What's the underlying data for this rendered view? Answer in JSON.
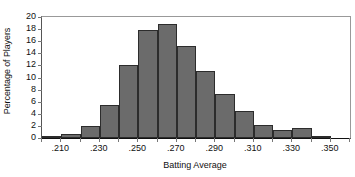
{
  "chart_data": {
    "type": "bar",
    "title": "",
    "subtitle": "",
    "xlabel": "Batting Average",
    "ylabel": "Percentage of Players",
    "grid": false,
    "legend": null,
    "legend_position": "none",
    "bar_color": "#6b6b6b",
    "bar_edge_color": "#2c2c2c",
    "axis_color": "#111111",
    "background": "#ffffff",
    "xlim": [
      0.2,
      0.36
    ],
    "ylim": [
      0,
      20
    ],
    "bin_width": 0.01,
    "x_tick_labels": [
      ".210",
      ".230",
      ".250",
      ".270",
      ".290",
      ".310",
      ".330",
      ".350"
    ],
    "x_tick_values": [
      0.21,
      0.23,
      0.25,
      0.27,
      0.29,
      0.31,
      0.33,
      0.35
    ],
    "x_minor_tick_values": [
      0.2,
      0.22,
      0.24,
      0.26,
      0.28,
      0.3,
      0.32,
      0.34,
      0.36
    ],
    "y_tick_labels": [
      "0",
      "2",
      "4",
      "6",
      "8",
      "10",
      "12",
      "14",
      "16",
      "18",
      "20"
    ],
    "y_tick_values": [
      0,
      2,
      4,
      6,
      8,
      10,
      12,
      14,
      16,
      18,
      20
    ],
    "categories": [
      ".200-.210",
      ".210-.220",
      ".220-.230",
      ".230-.240",
      ".240-.250",
      ".250-.260",
      ".260-.270",
      ".270-.280",
      ".280-.290",
      ".290-.300",
      ".300-.310",
      ".310-.320",
      ".320-.330",
      ".330-.340",
      ".340-.350",
      ".350-.360"
    ],
    "bin_edges": [
      0.2,
      0.21,
      0.22,
      0.23,
      0.24,
      0.25,
      0.26,
      0.27,
      0.28,
      0.29,
      0.3,
      0.31,
      0.32,
      0.33,
      0.34,
      0.35,
      0.36
    ],
    "values": [
      0.2,
      0.7,
      2.0,
      5.4,
      12.0,
      17.9,
      18.8,
      15.2,
      11.1,
      7.3,
      4.5,
      2.1,
      1.3,
      1.6,
      0.3,
      0.0
    ]
  }
}
